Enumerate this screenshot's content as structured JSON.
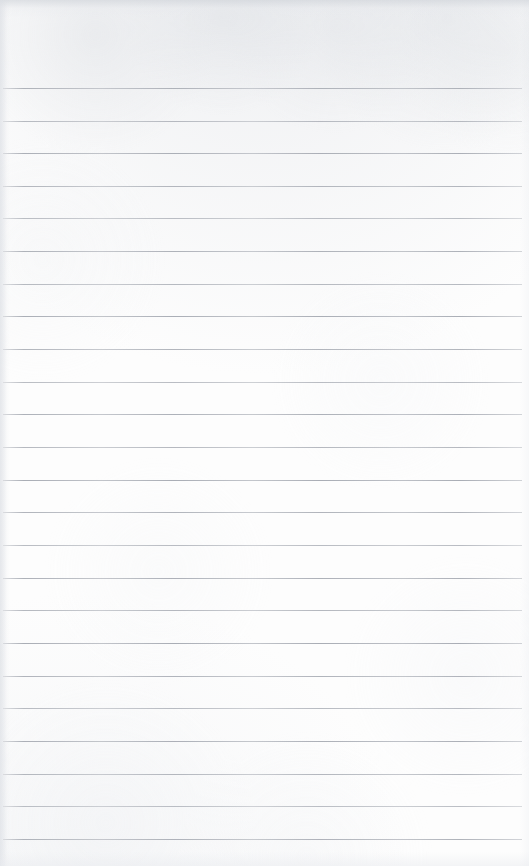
{
  "document": {
    "kind": "scanned-blank-ruled-notebook-page",
    "page_label": "",
    "header_text": "",
    "body_text": "",
    "footer_text": "",
    "width_px": 529,
    "height_px": 866
  },
  "appearance": {
    "paper_color": "#fdfdfd",
    "rule_color": "#a9adb5",
    "edge_shadow_color": "#ced2d8"
  },
  "ruling": {
    "first_line_y": 88,
    "line_spacing": 32.6,
    "line_count": 24,
    "line_left_x": 3,
    "line_right_x": 522,
    "line_thickness": 1,
    "top_margin_px": 88,
    "bottom_margin_px": 23,
    "has_vertical_margin_rule": false
  },
  "lines": [
    {
      "index": 1,
      "y": 88,
      "content": ""
    },
    {
      "index": 2,
      "y": 121,
      "content": ""
    },
    {
      "index": 3,
      "y": 153,
      "content": ""
    },
    {
      "index": 4,
      "y": 186,
      "content": ""
    },
    {
      "index": 5,
      "y": 218,
      "content": ""
    },
    {
      "index": 6,
      "y": 251,
      "content": ""
    },
    {
      "index": 7,
      "y": 284,
      "content": ""
    },
    {
      "index": 8,
      "y": 316,
      "content": ""
    },
    {
      "index": 9,
      "y": 349,
      "content": ""
    },
    {
      "index": 10,
      "y": 382,
      "content": ""
    },
    {
      "index": 11,
      "y": 414,
      "content": ""
    },
    {
      "index": 12,
      "y": 447,
      "content": ""
    },
    {
      "index": 13,
      "y": 480,
      "content": ""
    },
    {
      "index": 14,
      "y": 512,
      "content": ""
    },
    {
      "index": 15,
      "y": 545,
      "content": ""
    },
    {
      "index": 16,
      "y": 578,
      "content": ""
    },
    {
      "index": 17,
      "y": 610,
      "content": ""
    },
    {
      "index": 18,
      "y": 643,
      "content": ""
    },
    {
      "index": 19,
      "y": 676,
      "content": ""
    },
    {
      "index": 20,
      "y": 708,
      "content": ""
    },
    {
      "index": 21,
      "y": 741,
      "content": ""
    },
    {
      "index": 22,
      "y": 774,
      "content": ""
    },
    {
      "index": 23,
      "y": 806,
      "content": ""
    },
    {
      "index": 24,
      "y": 839,
      "content": ""
    }
  ]
}
